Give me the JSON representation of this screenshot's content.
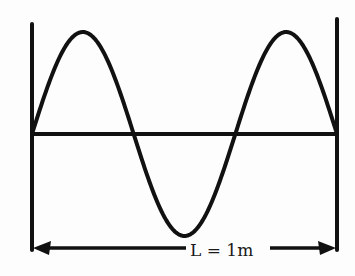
{
  "diagram": {
    "title": "",
    "label": "L = 1m",
    "colors": {
      "stroke": "#111111",
      "background": "#fdfdfd"
    },
    "geometry": {
      "left_wall_x": 32,
      "right_wall_x": 337,
      "baseline_y": 134,
      "amplitude_px": 102,
      "half_wavelengths": 3,
      "arrow_y": 248
    }
  }
}
